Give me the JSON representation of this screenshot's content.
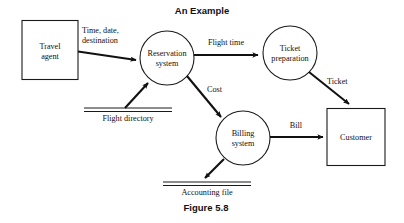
{
  "figure": {
    "title": "An Example",
    "caption": "Figure 5.8"
  },
  "diagram": {
    "type": "data-flow-diagram",
    "external_entities": [
      {
        "id": "travel-agent",
        "label_line1": "Travel",
        "label_line2": "agent"
      },
      {
        "id": "customer",
        "label_line1": "Customer",
        "label_line2": ""
      }
    ],
    "processes": [
      {
        "id": "reservation-system",
        "label_line1": "Reservation",
        "label_line2": "system"
      },
      {
        "id": "ticket-preparation",
        "label_line1": "Ticket",
        "label_line2": "preparation"
      },
      {
        "id": "billing-system",
        "label_line1": "Billing",
        "label_line2": "system"
      }
    ],
    "data_stores": [
      {
        "id": "flight-directory",
        "label": "Flight directory"
      },
      {
        "id": "accounting-file",
        "label": "Accounting file"
      }
    ],
    "data_flows": [
      {
        "id": "time-date-destination",
        "label_line1": "Time, date,",
        "label_line2": "destination",
        "from": "travel-agent",
        "to": "reservation-system"
      },
      {
        "id": "flight-time",
        "label_line1": "Flight time",
        "label_line2": "",
        "from": "reservation-system",
        "to": "ticket-preparation"
      },
      {
        "id": "ticket",
        "label_line1": "Ticket",
        "label_line2": "",
        "from": "ticket-preparation",
        "to": "customer"
      },
      {
        "id": "cost",
        "label_line1": "Cost",
        "label_line2": "",
        "from": "reservation-system",
        "to": "billing-system"
      },
      {
        "id": "bill",
        "label_line1": "Bill",
        "label_line2": "",
        "from": "billing-system",
        "to": "customer"
      },
      {
        "id": "flight-directory-read",
        "label_line1": "",
        "label_line2": "",
        "from": "flight-directory",
        "to": "reservation-system"
      },
      {
        "id": "accounting-file-write",
        "label_line1": "",
        "label_line2": "",
        "from": "billing-system",
        "to": "accounting-file"
      }
    ],
    "colors": {
      "stroke": "#1a1a1a",
      "text": "#111111",
      "background": "#ffffff"
    }
  }
}
